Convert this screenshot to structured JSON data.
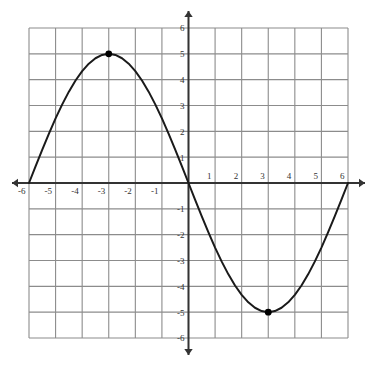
{
  "chart_data": {
    "type": "line",
    "title": "",
    "xlabel": "",
    "ylabel": "",
    "xlim": [
      -6,
      6
    ],
    "ylim": [
      -6,
      6
    ],
    "grid": true,
    "grid_step": 1,
    "legend_position": "none",
    "function": "y = -5 sin(pi x / 6)",
    "amplitude": 5,
    "period": 12,
    "x_tick_labels": [
      "-6",
      "-5",
      "-4",
      "-3",
      "-2",
      "-1",
      "1",
      "2",
      "3",
      "4",
      "5",
      "6"
    ],
    "x_tick_values": [
      -6,
      -5,
      -4,
      -3,
      -2,
      -1,
      1,
      2,
      3,
      4,
      5,
      6
    ],
    "y_tick_labels": [
      "6",
      "5",
      "4",
      "3",
      "2",
      "1",
      "-1",
      "-2",
      "-3",
      "-4",
      "-5",
      "-6"
    ],
    "y_tick_values": [
      6,
      5,
      4,
      3,
      2,
      1,
      -1,
      -2,
      -3,
      -4,
      -5,
      -6
    ],
    "series": [
      {
        "name": "curve",
        "color": "#1a1a1a",
        "x": [
          -6,
          -5.75,
          -5.5,
          -5.25,
          -5,
          -4.75,
          -4.5,
          -4.25,
          -4,
          -3.75,
          -3.5,
          -3.25,
          -3,
          -2.75,
          -2.5,
          -2.25,
          -2,
          -1.75,
          -1.5,
          -1.25,
          -1,
          -0.75,
          -0.5,
          -0.25,
          0,
          0.25,
          0.5,
          0.75,
          1,
          1.25,
          1.5,
          1.75,
          2,
          2.25,
          2.5,
          2.75,
          3,
          3.25,
          3.5,
          3.75,
          4,
          4.25,
          4.5,
          4.75,
          5,
          5.25,
          5.5,
          5.75,
          6
        ],
        "y": [
          0,
          0.654,
          1.294,
          1.913,
          2.5,
          3.045,
          3.536,
          3.967,
          4.33,
          4.619,
          4.83,
          4.957,
          5,
          4.957,
          4.83,
          4.619,
          4.33,
          3.967,
          3.536,
          3.045,
          2.5,
          1.913,
          1.294,
          0.654,
          0,
          -0.654,
          -1.294,
          -1.913,
          -2.5,
          -3.045,
          -3.536,
          -3.967,
          -4.33,
          -4.619,
          -4.83,
          -4.957,
          -5,
          -4.957,
          -4.83,
          -4.619,
          -4.33,
          -3.967,
          -3.536,
          -3.045,
          -2.5,
          -1.913,
          -1.294,
          -0.654,
          0
        ]
      }
    ],
    "marked_points": [
      {
        "label": "maximum",
        "x": -3,
        "y": 5
      },
      {
        "label": "minimum",
        "x": 3,
        "y": -5
      }
    ],
    "colors": {
      "curve": "#1a1a1a",
      "axis": "#333333",
      "grid": "#8c8c8c",
      "background": "#ffffff",
      "point": "#000000",
      "label": "#333333"
    }
  }
}
